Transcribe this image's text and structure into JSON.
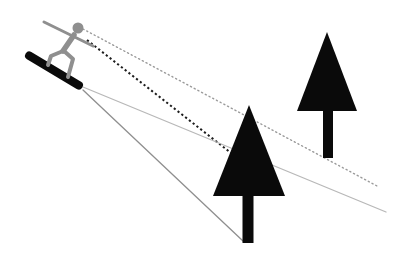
{
  "canvas": {
    "width": 397,
    "height": 268,
    "background": "#ffffff"
  },
  "scene": {
    "description": "Physics-style diagram of a snowboarder on a slope with sight lines (dotted) from the rider's eye and slope lines (solid) from the board, extending toward two black pine trees downhill.",
    "colors": {
      "figure_gray": "#8f8f8f",
      "tree_black": "#0a0a0a",
      "board_black": "#0a0a0a",
      "light_line": "#b8b8b8",
      "mid_line": "#9a9a9a",
      "dark_dotted": "#1c1c1c"
    },
    "sight_lines": [
      {
        "name": "sight-line-dotted-light",
        "style": "dotted",
        "from": [
          83,
          29
        ],
        "to": [
          379,
          187
        ],
        "color": "#9a9a9a",
        "width": 1.4,
        "dash": "1.2 3",
        "cap": "round"
      },
      {
        "name": "sight-line-dotted-dark",
        "style": "dotted",
        "from": [
          87,
          40
        ],
        "to": [
          231,
          153
        ],
        "color": "#1c1c1c",
        "width": 2,
        "dash": "2.2 2.6",
        "cap": "butt"
      },
      {
        "name": "slope-line-light",
        "style": "solid",
        "from": [
          83,
          87
        ],
        "to": [
          386,
          212
        ],
        "color": "#b8b8b8",
        "width": 1.3,
        "dash": "",
        "cap": "round"
      },
      {
        "name": "slope-line-dark",
        "style": "solid",
        "from": [
          83,
          90
        ],
        "to": [
          243,
          241
        ],
        "color": "#8f8f8f",
        "width": 1.3,
        "dash": "",
        "cap": "round"
      }
    ],
    "trees": [
      {
        "name": "near-tree",
        "color": "#0a0a0a",
        "canopy": [
          [
            249,
            105
          ],
          [
            213,
            196
          ],
          [
            285,
            196
          ]
        ],
        "trunk": {
          "x": 242.5,
          "y": 192,
          "width": 11,
          "height": 51
        }
      },
      {
        "name": "far-tree",
        "color": "#0a0a0a",
        "canopy": [
          [
            327,
            32
          ],
          [
            297,
            111
          ],
          [
            357,
            111
          ]
        ],
        "trunk": {
          "x": 323,
          "y": 107,
          "width": 10,
          "height": 51
        }
      }
    ],
    "snowboarder": {
      "color": "#8f8f8f",
      "board": {
        "cx": 54,
        "cy": 70.5,
        "length": 66,
        "thickness": 8.5,
        "angle_deg": 31,
        "corner_radius": 4,
        "color": "#0a0a0a"
      },
      "head": {
        "cx": 78,
        "cy": 28,
        "r": 5.5
      },
      "arm": {
        "from": [
          44,
          22
        ],
        "to": [
          93,
          46
        ],
        "width": 3
      },
      "torso": {
        "from": [
          74,
          35
        ],
        "to": [
          63,
          51
        ],
        "width": 5.5
      },
      "legs": [
        {
          "points": [
            [
              63,
              51
            ],
            [
              51,
              56
            ],
            [
              48,
              65
            ]
          ],
          "width": 4
        },
        {
          "points": [
            [
              64,
              51
            ],
            [
              73,
              59
            ],
            [
              68,
              77
            ]
          ],
          "width": 4
        }
      ]
    }
  }
}
